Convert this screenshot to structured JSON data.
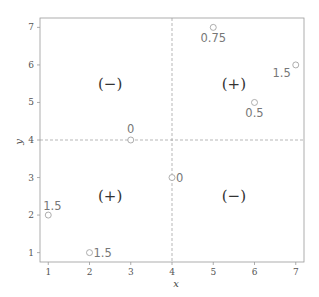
{
  "chart_data": {
    "type": "scatter",
    "title": "",
    "xlabel": "x",
    "ylabel": "y",
    "xlim": [
      0.8,
      7.2
    ],
    "ylim": [
      0.75,
      7.25
    ],
    "x_ticks": [
      1,
      2,
      3,
      4,
      5,
      6,
      7
    ],
    "y_ticks": [
      1,
      2,
      3,
      4,
      5,
      6,
      7
    ],
    "grid": false,
    "reference_lines": {
      "x": 4,
      "y": 4
    },
    "points": [
      {
        "x": 1,
        "y": 2,
        "label": "1.5",
        "label_pos": "top-right"
      },
      {
        "x": 2,
        "y": 1,
        "label": "1.5",
        "label_pos": "right"
      },
      {
        "x": 3,
        "y": 4,
        "label": "0",
        "label_pos": "top"
      },
      {
        "x": 4,
        "y": 3,
        "label": "0",
        "label_pos": "right"
      },
      {
        "x": 5,
        "y": 7,
        "label": "0.75",
        "label_pos": "bottom"
      },
      {
        "x": 6,
        "y": 5,
        "label": "0.5",
        "label_pos": "bottom"
      },
      {
        "x": 7,
        "y": 6,
        "label": "1.5",
        "label_pos": "bottom-left"
      }
    ],
    "region_labels": [
      {
        "x": 2.5,
        "y": 5.5,
        "text": "(−)"
      },
      {
        "x": 5.5,
        "y": 5.5,
        "text": "(+)"
      },
      {
        "x": 2.5,
        "y": 2.5,
        "text": "(+)"
      },
      {
        "x": 5.5,
        "y": 2.5,
        "text": "(−)"
      }
    ],
    "colors": {
      "axis": "#999999",
      "reference_line": "#999999",
      "point_stroke": "#999999"
    }
  }
}
